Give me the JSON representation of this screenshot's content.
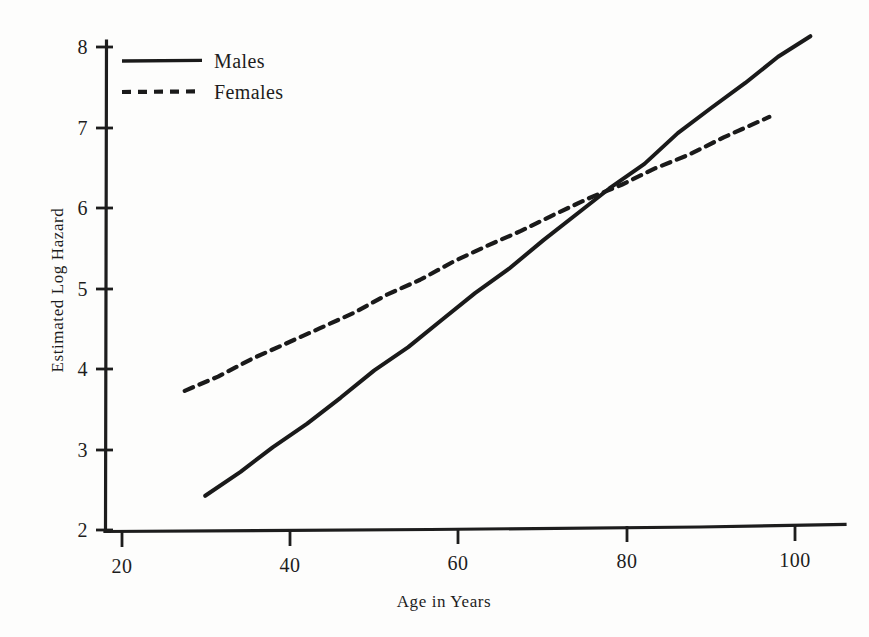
{
  "chart_data": {
    "type": "line",
    "title": "",
    "subtitle": "",
    "xlabel": "Age in Years",
    "ylabel": "Estimated Log Hazard",
    "xlim": [
      18,
      106
    ],
    "ylim": [
      1.85,
      8.35
    ],
    "xticks": [
      20,
      40,
      60,
      80,
      100
    ],
    "xtick_labels": [
      "20",
      "40",
      "60",
      "80",
      "100"
    ],
    "yticks": [
      2,
      3,
      4,
      5,
      6,
      7,
      8
    ],
    "ytick_labels": [
      "2",
      "3",
      "4",
      "5",
      "6",
      "7",
      "8"
    ],
    "grid": false,
    "legend_position": "top-left",
    "annotations": [],
    "series": [
      {
        "name": "Males",
        "style": "solid",
        "color": "#1a1a1a",
        "x": [
          30.0,
          34.0,
          38.0,
          42.0,
          46.0,
          50.0,
          54.0,
          58.0,
          62.0,
          66.0,
          70.0,
          74.0,
          78.0,
          82.0,
          86.0,
          90.0,
          94.0,
          98.0,
          101.8
        ],
        "y": [
          2.4,
          2.7,
          3.01,
          3.32,
          3.63,
          3.94,
          4.26,
          4.58,
          4.9,
          5.22,
          5.55,
          5.88,
          6.18,
          6.5,
          6.87,
          7.18,
          7.48,
          7.79,
          8.05
        ]
      },
      {
        "name": "Females",
        "style": "dashed",
        "color": "#1a1a1a",
        "x": [
          27.5,
          31.5,
          35.5,
          39.5,
          43.5,
          47.5,
          51.5,
          55.5,
          59.5,
          63.5,
          67.5,
          71.5,
          75.5,
          79.5,
          83.5,
          87.5,
          91.5,
          97.0
        ],
        "y": [
          3.72,
          3.91,
          4.11,
          4.3,
          4.49,
          4.69,
          4.88,
          5.08,
          5.28,
          5.47,
          5.67,
          5.87,
          6.07,
          6.25,
          6.43,
          6.62,
          6.8,
          7.07
        ]
      }
    ]
  },
  "legend": {
    "entries": [
      {
        "label": "Males",
        "style": "solid"
      },
      {
        "label": "Females",
        "style": "dashed"
      }
    ]
  },
  "axes": {
    "x_title": "Age in Years",
    "y_title": "Estimated Log Hazard"
  }
}
